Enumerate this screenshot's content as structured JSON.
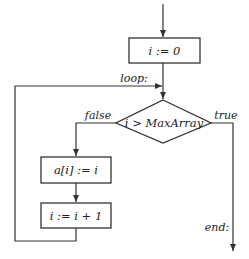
{
  "diagram": {
    "type": "flowchart",
    "nodes": {
      "init": {
        "label": "i := 0"
      },
      "condition": {
        "label": "i > MaxArray"
      },
      "assign": {
        "label": "a[i] := i"
      },
      "increment": {
        "label": "i := i + 1"
      }
    },
    "edge_labels": {
      "loop": "loop:",
      "false": "false",
      "true": "true",
      "end": "end:"
    },
    "colors": {
      "line": "#333333",
      "background": "#ffffff"
    }
  }
}
